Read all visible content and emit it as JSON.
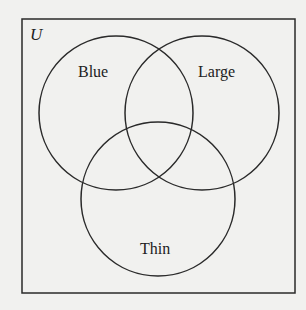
{
  "diagram": {
    "type": "venn",
    "universe_label": "U",
    "sets": [
      {
        "label": "Blue"
      },
      {
        "label": "Large"
      },
      {
        "label": "Thin"
      }
    ],
    "colors": {
      "stroke": "#2a2a2a",
      "background": "#f1f1ef"
    }
  }
}
